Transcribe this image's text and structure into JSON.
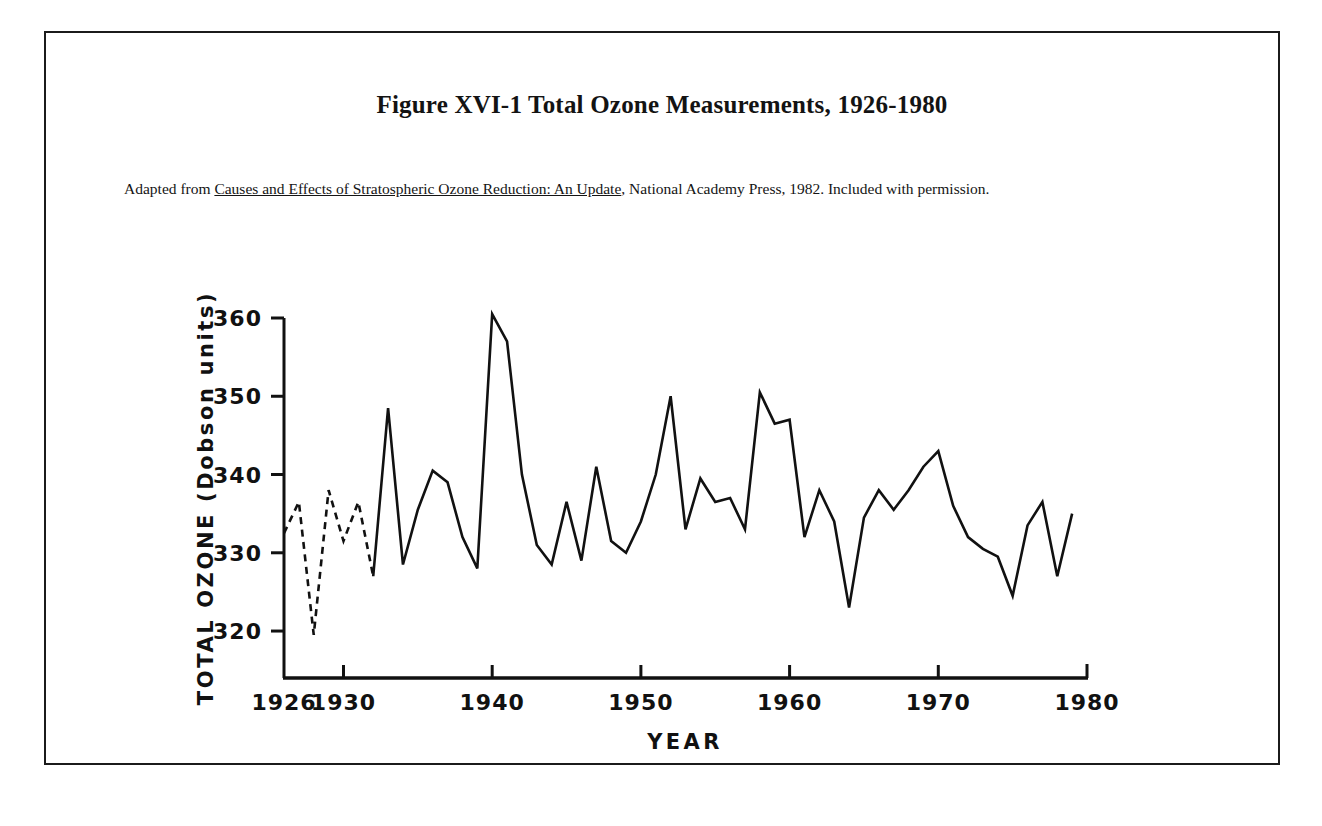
{
  "figure": {
    "title": "Figure XVI-1  Total Ozone Measurements, 1926-1980",
    "caption_prefix": "Adapted from ",
    "caption_source_title": "Causes and Effects of Stratospheric Ozone Reduction: An Update",
    "caption_suffix": ", National Academy Press, 1982. Included with permission.",
    "border_color": "#1b1b1b"
  },
  "chart_data": {
    "type": "line",
    "title": "Figure XVI-1  Total Ozone Measurements, 1926-1980",
    "xlabel": "YEAR",
    "ylabel": "TOTAL OZONE (Dobson units)",
    "xlim": [
      1926,
      1980
    ],
    "ylim": [
      314,
      360
    ],
    "grid": false,
    "legend": null,
    "line_color": "#111111",
    "xticks": [
      1926,
      1930,
      1940,
      1950,
      1960,
      1970,
      1980
    ],
    "xtick_labels": [
      "1926",
      "1930",
      "1940",
      "1950",
      "1960",
      "1970",
      "1980"
    ],
    "yticks": [
      320,
      330,
      340,
      350,
      360
    ],
    "ytick_labels": [
      "320",
      "330",
      "340",
      "350",
      "360"
    ],
    "series": [
      {
        "name": "Total ozone (estimated, dashed)",
        "style": "dashed",
        "x": [
          1926,
          1927,
          1928,
          1929,
          1930,
          1931,
          1932
        ],
        "values": [
          332.5,
          336.5,
          319.5,
          338.0,
          331.5,
          336.5,
          327.0
        ]
      },
      {
        "name": "Total ozone (measured, solid)",
        "style": "solid",
        "x": [
          1932,
          1933,
          1934,
          1935,
          1936,
          1937,
          1938,
          1939,
          1940,
          1941,
          1942,
          1943,
          1944,
          1945,
          1946,
          1947,
          1948,
          1949,
          1950,
          1951,
          1952,
          1953,
          1954,
          1955,
          1956,
          1957,
          1958,
          1959,
          1960,
          1961,
          1962,
          1963,
          1964,
          1965,
          1966,
          1967,
          1968,
          1969,
          1970,
          1971,
          1972,
          1973,
          1974,
          1975,
          1976,
          1977,
          1978,
          1979
        ],
        "values": [
          327.0,
          348.5,
          328.5,
          335.5,
          340.5,
          339.0,
          332.0,
          328.0,
          360.5,
          357.0,
          340.0,
          331.0,
          328.5,
          336.5,
          329.0,
          341.0,
          331.5,
          330.0,
          334.0,
          340.0,
          350.0,
          333.0,
          339.5,
          336.5,
          337.0,
          333.0,
          350.5,
          346.5,
          347.0,
          332.0,
          338.0,
          334.0,
          323.0,
          334.5,
          338.0,
          335.5,
          338.0,
          341.0,
          343.0,
          336.0,
          332.0,
          330.5,
          329.5,
          324.5,
          333.5,
          336.5,
          327.0,
          335.0
        ]
      }
    ]
  }
}
